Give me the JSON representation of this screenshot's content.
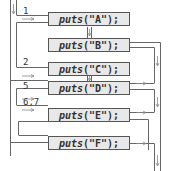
{
  "diagram": {
    "type": "control-flow",
    "statements": [
      {
        "id": "A",
        "fn": "puts",
        "arg": "(\"A\");"
      },
      {
        "id": "B",
        "fn": "puts",
        "arg": "(\"B\");"
      },
      {
        "id": "C",
        "fn": "puts",
        "arg": "(\"C\");"
      },
      {
        "id": "D",
        "fn": "puts",
        "arg": "(\"D\");"
      },
      {
        "id": "E",
        "fn": "puts",
        "arg": "(\"E\");"
      },
      {
        "id": "F",
        "fn": "puts",
        "arg": "(\"F\");"
      }
    ],
    "labels": [
      {
        "text": "1",
        "target": "A"
      },
      {
        "text": "2",
        "target": "C"
      },
      {
        "text": "5",
        "target": "D"
      },
      {
        "text": "6,7",
        "target": "E"
      }
    ],
    "colors": {
      "line": "#555555",
      "box_fill": "#e8e8e8",
      "text": "#333333"
    }
  }
}
